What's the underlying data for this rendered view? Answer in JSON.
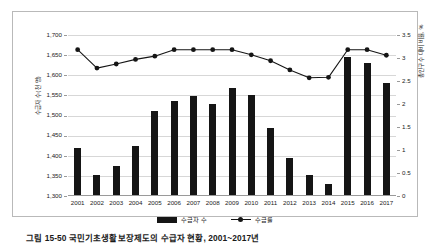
{
  "figure": {
    "caption": "그림 15-50  국민기초생활보장제도의 수급자 현황, 2001~2017년"
  },
  "chart_data": {
    "type": "bar",
    "title": "",
    "subtitle": "",
    "xlabel": "",
    "ylabel": "수급자 수(천 명)",
    "y2label": "총인구수 대비 비율, %",
    "grid": true,
    "legend_position": "bottom",
    "ylim": [
      1300,
      1700
    ],
    "y2lim": [
      0,
      3.5
    ],
    "yticks": [
      "1,300",
      "1,350",
      "1,400",
      "1,450",
      "1,500",
      "1,550",
      "1,600",
      "1,650",
      "1,700"
    ],
    "y2ticks": [
      "0",
      "0.5",
      "1",
      "1.5",
      "2",
      "2.5",
      "3",
      "3.5"
    ],
    "categories": [
      "2001",
      "2002",
      "2003",
      "2004",
      "2005",
      "2006",
      "2007",
      "2008",
      "2009",
      "2010",
      "2011",
      "2012",
      "2013",
      "2014",
      "2015",
      "2016",
      "2017"
    ],
    "series": [
      {
        "name": "수급자 수",
        "kind": "bar",
        "axis": "left",
        "color": "#151515",
        "values": [
          1420,
          1351,
          1374,
          1424,
          1511,
          1535,
          1549,
          1529,
          1569,
          1550,
          1469,
          1394,
          1351,
          1329,
          1646,
          1630,
          1581
        ]
      },
      {
        "name": "수급률",
        "kind": "line",
        "axis": "right",
        "color": "#151515",
        "values": [
          3.18,
          2.78,
          2.87,
          2.97,
          3.04,
          3.18,
          3.18,
          3.18,
          3.18,
          3.07,
          2.94,
          2.74,
          2.57,
          2.58,
          3.18,
          3.18,
          3.06
        ]
      }
    ]
  },
  "legend": {
    "items": [
      {
        "label": "수급자 수"
      },
      {
        "label": "수급률"
      }
    ]
  }
}
